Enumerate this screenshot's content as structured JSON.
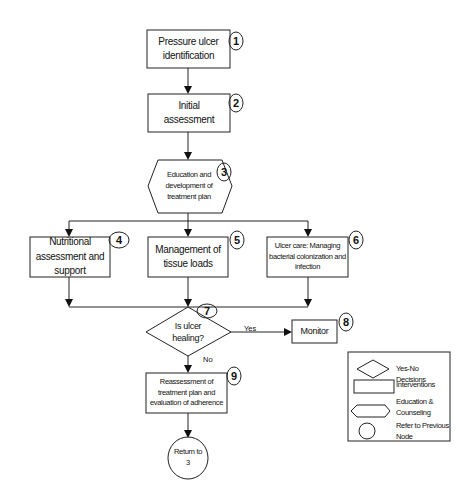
{
  "nodes": [
    {
      "id": 1,
      "type": "intervention",
      "label": "Pressure ulcer identification"
    },
    {
      "id": 2,
      "type": "intervention",
      "label": "Initial assessment"
    },
    {
      "id": 3,
      "type": "education",
      "label": "Education and development of treatment plan"
    },
    {
      "id": 4,
      "type": "intervention",
      "label": "Nutritional assessment and support"
    },
    {
      "id": 5,
      "type": "intervention",
      "label": "Management of tissue loads"
    },
    {
      "id": 6,
      "type": "intervention",
      "label": "Ulcer care: Managing bacterial colonization and infection"
    },
    {
      "id": 7,
      "type": "decision",
      "label": "Is ulcer healing?"
    },
    {
      "id": 8,
      "type": "intervention",
      "label": "Monitor"
    },
    {
      "id": 9,
      "type": "intervention",
      "label": "Reassessment of treatment plan and evaluation of adherence"
    },
    {
      "id": "ref",
      "type": "reference",
      "label": "Return to 3"
    }
  ],
  "node_numbers": [
    "1",
    "2",
    "3",
    "4",
    "5",
    "6",
    "7",
    "8",
    "9"
  ],
  "edges": {
    "yes_label": "Yes",
    "no_label": "No"
  },
  "legend": {
    "items": [
      {
        "shape": "diamond",
        "label": "Yes-No Decisions"
      },
      {
        "shape": "rectangle",
        "label": "Interventions"
      },
      {
        "shape": "hexagon",
        "label": "Education & Counseling"
      },
      {
        "shape": "circle",
        "label": "Refer to Previous Node"
      }
    ]
  },
  "colors": {
    "stroke": "#222222",
    "background": "#ffffff",
    "text": "#111111"
  }
}
